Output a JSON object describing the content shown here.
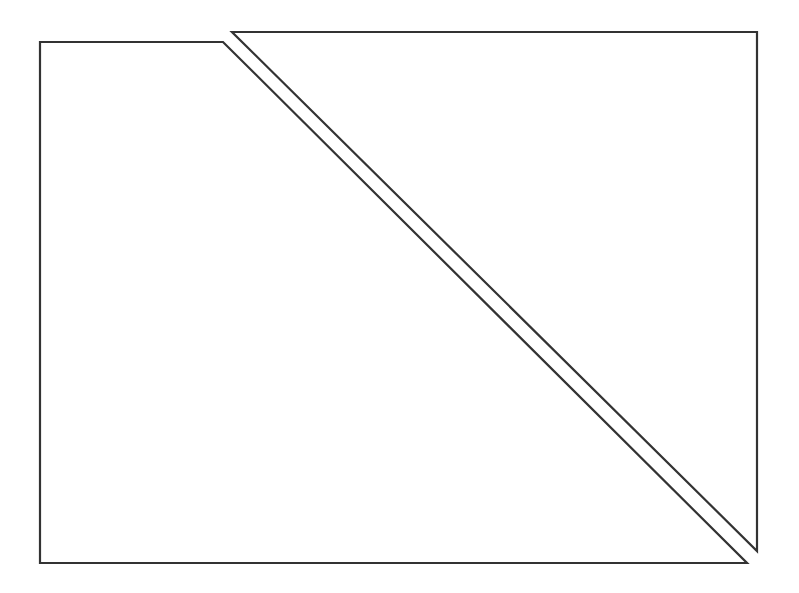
{
  "canvas": {
    "width": 799,
    "height": 593,
    "background": "#ffffff",
    "stroke_color": "#333333",
    "stroke_width": 2.2
  },
  "shapes": [
    {
      "name": "left-trapezoid",
      "type": "polygon",
      "points": [
        [
          40,
          42
        ],
        [
          223,
          42
        ],
        [
          747,
          563
        ],
        [
          40,
          563
        ]
      ]
    },
    {
      "name": "right-triangle",
      "type": "polygon",
      "points": [
        [
          232,
          32
        ],
        [
          757,
          32
        ],
        [
          757,
          551
        ]
      ]
    }
  ]
}
